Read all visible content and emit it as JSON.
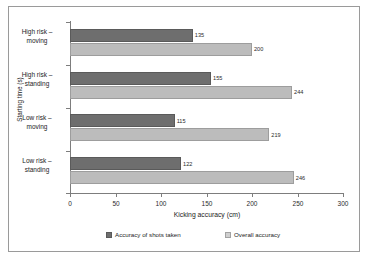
{
  "chart_data": {
    "type": "bar",
    "orientation": "horizontal",
    "title": "",
    "xlabel": "Kicking   accuracy (cm)",
    "ylabel": "Starting time (s)",
    "categories": [
      "High risk –\nmoving",
      "High risk –\nstanding",
      "Low risk –\nmoving",
      "Low risk –\nstanding"
    ],
    "series": [
      {
        "name": "Accuracy of shots taken",
        "color": "#6e6e6e",
        "values": [
          135,
          155,
          115,
          122
        ]
      },
      {
        "name": "Overall accuracy",
        "color": "#bcbcbc",
        "values": [
          200,
          244,
          219,
          246
        ]
      }
    ],
    "xlim": [
      0,
      300
    ],
    "xticks": [
      0,
      50,
      100,
      150,
      200,
      250,
      300
    ],
    "xtick_labels": [
      "0",
      "50",
      "100",
      "150",
      "200",
      "250",
      "300"
    ],
    "grid": false,
    "legend_position": "bottom",
    "data_labels": true
  },
  "legend": {
    "items": [
      {
        "label": "Accuracy of shots taken",
        "swatch": "dark"
      },
      {
        "label": "Overall accuracy",
        "swatch": "light"
      }
    ]
  }
}
